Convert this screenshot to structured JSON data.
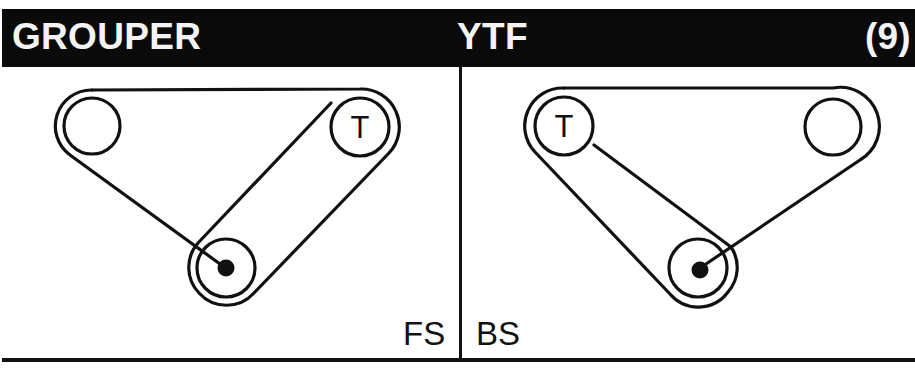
{
  "header": {
    "title_left": "GROUPER",
    "title_mid": "YTF",
    "title_right": "(9)"
  },
  "panels": [
    {
      "id": "front",
      "label": "FS",
      "pulleys": [
        {
          "name": "idler",
          "cx": 92,
          "cy": 126,
          "r": 28,
          "label": ""
        },
        {
          "name": "tensioner",
          "cx": 360,
          "cy": 127,
          "r": 29,
          "label": "T"
        },
        {
          "name": "crankshaft",
          "cx": 226,
          "cy": 268,
          "r": 29,
          "label": ""
        }
      ]
    },
    {
      "id": "back",
      "label": "BS",
      "pulleys": [
        {
          "name": "tensioner",
          "cx": 564,
          "cy": 126,
          "r": 29,
          "label": "T"
        },
        {
          "name": "idler",
          "cx": 833,
          "cy": 127,
          "r": 28,
          "label": ""
        },
        {
          "name": "crankshaft",
          "cx": 698,
          "cy": 268,
          "r": 29,
          "label": ""
        }
      ]
    }
  ],
  "colors": {
    "header_bg": "#0a0a0a",
    "header_text": "#f4f4f4",
    "line": "#111111"
  }
}
